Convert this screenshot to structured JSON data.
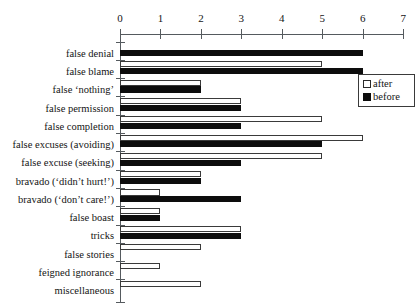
{
  "chart_data": {
    "type": "bar",
    "orientation": "horizontal",
    "title": "",
    "subtitle": "",
    "xlabel": "",
    "ylabel": "",
    "xlim": [
      0,
      7
    ],
    "xticks": [
      0,
      1,
      2,
      3,
      4,
      5,
      6,
      7
    ],
    "xtick_labels": [
      "0",
      "1",
      "2",
      "3",
      "4",
      "5",
      "6",
      "7"
    ],
    "grid": false,
    "axis_position": "top",
    "legend": {
      "position": "right-upper",
      "entries": [
        {
          "name": "after",
          "color": "#ffffff",
          "edge": "#2b2b2b"
        },
        {
          "name": "before",
          "color": "#0d0d0d",
          "edge": "#0d0d0d"
        }
      ]
    },
    "categories": [
      "false denial",
      "false blame",
      "false ‘nothing’",
      "false permission",
      "false completion",
      "false excuses (avoiding)",
      "false excuse (seeking)",
      "bravado (‘didn’t hurt!’)",
      "bravado (‘don’t care!’)",
      "false boast",
      "tricks",
      "false stories",
      "feigned ignorance",
      "miscellaneous"
    ],
    "series": [
      {
        "name": "after",
        "color": "#ffffff",
        "values": [
          0,
          5,
          2,
          3,
          5,
          6,
          5,
          2,
          1,
          1,
          3,
          2,
          1,
          2
        ]
      },
      {
        "name": "before",
        "color": "#0d0d0d",
        "values": [
          6,
          6,
          2,
          3,
          3,
          5,
          3,
          2,
          3,
          1,
          3,
          0,
          0,
          0
        ]
      }
    ]
  }
}
